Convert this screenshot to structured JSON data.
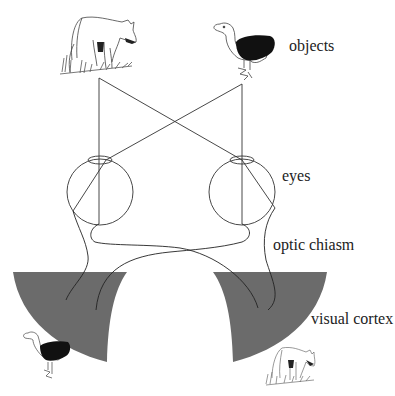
{
  "diagram": {
    "labels": {
      "objects": "objects",
      "eyes": "eyes",
      "optic_chiasm": "optic chiasm",
      "visual_cortex": "visual cortex"
    },
    "objects": [
      {
        "name": "wolf",
        "side": "left",
        "role": "object"
      },
      {
        "name": "bird",
        "side": "right",
        "role": "object"
      }
    ],
    "cortex_images": [
      {
        "name": "bird",
        "side": "left",
        "role": "projected image"
      },
      {
        "name": "wolf",
        "side": "right",
        "role": "projected image"
      }
    ],
    "colors": {
      "cortex_fill": "#6b6b6b",
      "line": "#333333",
      "bird_wing": "#111111"
    }
  }
}
